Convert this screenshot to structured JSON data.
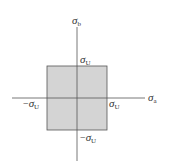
{
  "diagram": {
    "type": "failure-envelope",
    "colors": {
      "region_fill": "#d4d4d4",
      "region_stroke": "#555555",
      "axis": "#555555",
      "text": "#333333",
      "background": "#ffffff"
    },
    "axes": {
      "horizontal": {
        "symbol": "σ",
        "subscript": "a"
      },
      "vertical": {
        "symbol": "σ",
        "subscript": "b"
      }
    },
    "labels": {
      "top": {
        "prefix": "",
        "symbol": "σ",
        "subscript": "U"
      },
      "right": {
        "prefix": "",
        "symbol": "σ",
        "subscript": "U"
      },
      "left": {
        "prefix": "−",
        "symbol": "σ",
        "subscript": "U"
      },
      "bottom": {
        "prefix": "−",
        "symbol": "σ",
        "subscript": "U"
      }
    }
  }
}
